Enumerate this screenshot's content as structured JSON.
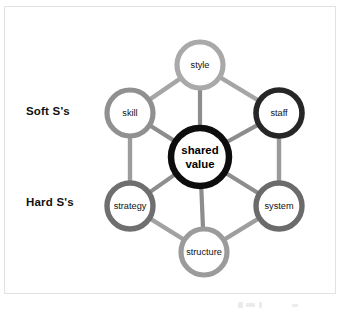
{
  "diagram": {
    "type": "hexagonal-network",
    "side_labels": [
      {
        "id": "soft",
        "text": "Soft S's",
        "x": 26,
        "y": 105
      },
      {
        "id": "hard",
        "text": "Hard S's",
        "x": 26,
        "y": 196
      }
    ],
    "center": {
      "id": "shared-value",
      "line1": "shared",
      "line2": "value",
      "cx": 200,
      "cy": 157,
      "r": 29,
      "ring_color": "#0d0d0d",
      "ring_width": 6.5,
      "fill": "#ffffff",
      "group": "core"
    },
    "nodes": [
      {
        "id": "style",
        "label": "style",
        "cx": 200,
        "cy": 65,
        "r": 23,
        "ring_color": "#a9a9a9",
        "ring_width": 5.2,
        "fill": "#ffffff",
        "group": "soft"
      },
      {
        "id": "staff",
        "label": "staff",
        "cx": 279,
        "cy": 113,
        "r": 23,
        "ring_color": "#262626",
        "ring_width": 5.6,
        "fill": "#ffffff",
        "group": "soft"
      },
      {
        "id": "system",
        "label": "system",
        "cx": 279,
        "cy": 206,
        "r": 23,
        "ring_color": "#6b6b6b",
        "ring_width": 5.4,
        "fill": "#ffffff",
        "group": "hard"
      },
      {
        "id": "structure",
        "label": "structure",
        "cx": 204,
        "cy": 252,
        "r": 23,
        "ring_color": "#9b9b9b",
        "ring_width": 5.2,
        "fill": "#ffffff",
        "group": "hard"
      },
      {
        "id": "strategy",
        "label": "strategy",
        "cx": 130,
        "cy": 206,
        "r": 23,
        "ring_color": "#6f6f6f",
        "ring_width": 5.4,
        "fill": "#ffffff",
        "group": "hard"
      },
      {
        "id": "skill",
        "label": "skill",
        "cx": 130,
        "cy": 113,
        "r": 23,
        "ring_color": "#909090",
        "ring_width": 5.2,
        "fill": "#ffffff",
        "group": "soft"
      }
    ],
    "ring_edges": [
      {
        "from": "style",
        "to": "staff",
        "color": "#a5a5a5",
        "width": 4.4
      },
      {
        "from": "staff",
        "to": "system",
        "color": "#9a9a9a",
        "width": 4.4
      },
      {
        "from": "system",
        "to": "structure",
        "color": "#9e9e9e",
        "width": 4.4
      },
      {
        "from": "structure",
        "to": "strategy",
        "color": "#a2a2a2",
        "width": 4.4
      },
      {
        "from": "strategy",
        "to": "skill",
        "color": "#9c9c9c",
        "width": 4.4
      },
      {
        "from": "skill",
        "to": "style",
        "color": "#a6a6a6",
        "width": 4.4
      }
    ],
    "spoke_edges": [
      {
        "from": "style",
        "to": "shared-value",
        "color": "#8d8d8d",
        "width": 4.2
      },
      {
        "from": "staff",
        "to": "shared-value",
        "color": "#8d8d8d",
        "width": 4.2
      },
      {
        "from": "system",
        "to": "shared-value",
        "color": "#8d8d8d",
        "width": 4.2
      },
      {
        "from": "structure",
        "to": "shared-value",
        "color": "#8d8d8d",
        "width": 4.2
      },
      {
        "from": "strategy",
        "to": "shared-value",
        "color": "#8d8d8d",
        "width": 4.2
      },
      {
        "from": "skill",
        "to": "shared-value",
        "color": "#8d8d8d",
        "width": 4.2
      }
    ],
    "frame": {
      "border_color": "#e2e2e2",
      "background": "#ffffff"
    }
  }
}
